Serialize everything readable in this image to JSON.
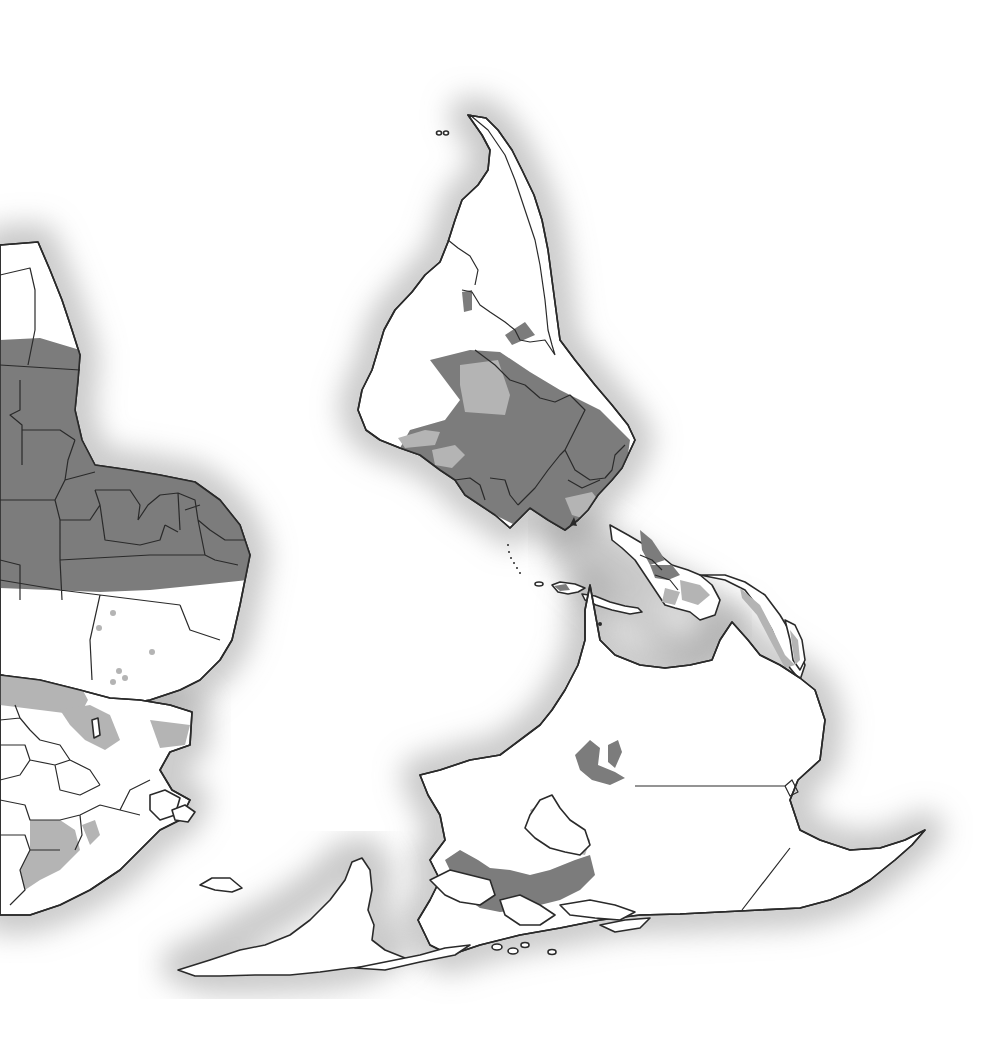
{
  "map": {
    "orientation": "south-up (inverted)",
    "projection_view": "Western hemisphere with parts of Africa and Europe, shown upside down",
    "labels": [],
    "legend": null,
    "colors": {
      "background": "#ffffff",
      "land": "#ffffff",
      "outline": "#2a2a2a",
      "coastal_halo": "#9a9a9a",
      "dark_shading": "#7c7c7c",
      "light_shading": "#b4b4b4"
    },
    "regions": [
      {
        "name": "south-america",
        "shading": "partial dark and light shading across central/northern interior"
      },
      {
        "name": "central-america",
        "shading": "dark and light shading along isthmus"
      },
      {
        "name": "caribbean-islands",
        "shading": "partial dark shading"
      },
      {
        "name": "north-america",
        "shading": "light shading on eastern coastal band and around lakes"
      },
      {
        "name": "greenland",
        "shading": "none"
      },
      {
        "name": "africa-partial",
        "shading": "dark band across central region, light spots in north"
      },
      {
        "name": "europe-partial",
        "shading": "light shading in parts"
      }
    ]
  }
}
